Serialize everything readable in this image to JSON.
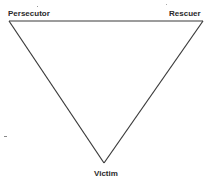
{
  "diagram": {
    "type": "triangle",
    "stroke_color": "#3a3a3a",
    "background": "#ffffff",
    "nodes": [
      {
        "id": "persecutor",
        "label": "Persecutor",
        "position": "top-left",
        "x": 9,
        "y": 21
      },
      {
        "id": "rescuer",
        "label": "Rescuer",
        "position": "top-right",
        "x": 203,
        "y": 21
      },
      {
        "id": "victim",
        "label": "Victim",
        "position": "bottom",
        "x": 104,
        "y": 163
      }
    ],
    "edges": [
      {
        "from": "persecutor",
        "to": "rescuer"
      },
      {
        "from": "rescuer",
        "to": "victim"
      },
      {
        "from": "victim",
        "to": "persecutor"
      }
    ]
  }
}
